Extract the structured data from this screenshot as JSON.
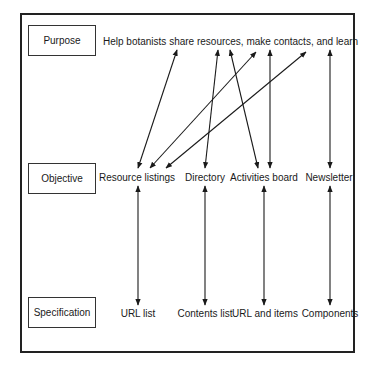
{
  "diagram": {
    "rows": {
      "purpose": {
        "label": "Purpose",
        "text": "Help botanists share resources, make contacts, and learn"
      },
      "objective": {
        "label": "Objective",
        "items": [
          "Resource listings",
          "Directory",
          "Activities board",
          "Newsletter"
        ]
      },
      "specification": {
        "label": "Specification",
        "items": [
          "URL list",
          "Contents list",
          "URL and items",
          "Components"
        ]
      }
    },
    "links_purpose_to_objective": [
      {
        "from": "share",
        "to": "Resource listings"
      },
      {
        "from": "resources",
        "to": "Directory"
      },
      {
        "from": "resources",
        "to": "Activities board"
      },
      {
        "from": "make contacts",
        "to": "Resource listings"
      },
      {
        "from": "contacts",
        "to": "Activities board"
      },
      {
        "from": "learn",
        "to": "Resource listings"
      },
      {
        "from": "learn",
        "to": "Newsletter"
      }
    ],
    "links_objective_to_specification": [
      {
        "from": "Resource listings",
        "to": "URL list"
      },
      {
        "from": "Directory",
        "to": "Contents list"
      },
      {
        "from": "Activities board",
        "to": "URL and items"
      },
      {
        "from": "Newsletter",
        "to": "Components"
      }
    ],
    "colors": {
      "line": "#1a1a1a",
      "background": "#ffffff"
    }
  }
}
